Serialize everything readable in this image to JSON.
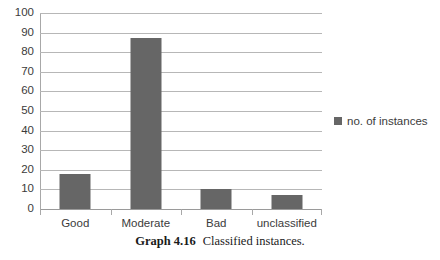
{
  "chart_data": {
    "type": "bar",
    "title": "",
    "xlabel": "",
    "ylabel": "",
    "categories": [
      "Good",
      "Moderate",
      "Bad",
      "unclassified"
    ],
    "values": [
      18,
      87,
      10,
      7
    ],
    "series": [
      {
        "name": "no. of instances",
        "values": [
          18,
          87,
          10,
          7
        ],
        "color": "#666666"
      }
    ],
    "ylim": [
      0,
      100
    ],
    "y_ticks": [
      0,
      10,
      20,
      30,
      40,
      50,
      60,
      70,
      80,
      90,
      100
    ],
    "y_tick_labels": [
      "0",
      "10",
      "20",
      "30",
      "40",
      "50",
      "60",
      "70",
      "80",
      "90",
      "100"
    ],
    "grid": true,
    "grid_axis": "y",
    "legend_position": "right",
    "legend_entries": [
      "no. of instances"
    ]
  },
  "legend": {
    "label": "no. of instances",
    "swatch_color": "#666666"
  },
  "caption": {
    "number": "Graph 4.16",
    "text": "Classified instances."
  },
  "colors": {
    "bar": "#666666",
    "gridline": "#b7b7b7",
    "axis": "#a8a8a8",
    "background": "#ffffff",
    "tick_text": "#3b3b3b",
    "caption_text": "#1a1a1a"
  }
}
